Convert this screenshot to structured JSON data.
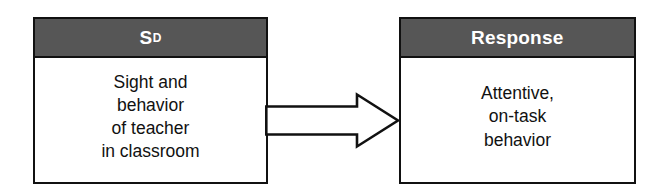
{
  "diagram": {
    "type": "flow",
    "orientation": "left-to-right",
    "accent_color": "#565656",
    "outline_color": "#111111",
    "background_color": "#ffffff",
    "header_text_color": "#ffffff",
    "body_text_color": "#111111"
  },
  "nodes": [
    {
      "id": "antecedent",
      "header": {
        "base": "S",
        "superscript": "D"
      },
      "body_lines": [
        "Sight and",
        "behavior",
        "of teacher",
        "in classroom"
      ]
    },
    {
      "id": "response",
      "header": {
        "base": "Response",
        "superscript": ""
      },
      "body_lines": [
        "Attentive,",
        "on-task",
        "behavior"
      ]
    }
  ],
  "connector": {
    "icon": "block-arrow-right-icon",
    "from": "antecedent",
    "to": "response",
    "fill": "#ffffff",
    "stroke": "#111111"
  }
}
